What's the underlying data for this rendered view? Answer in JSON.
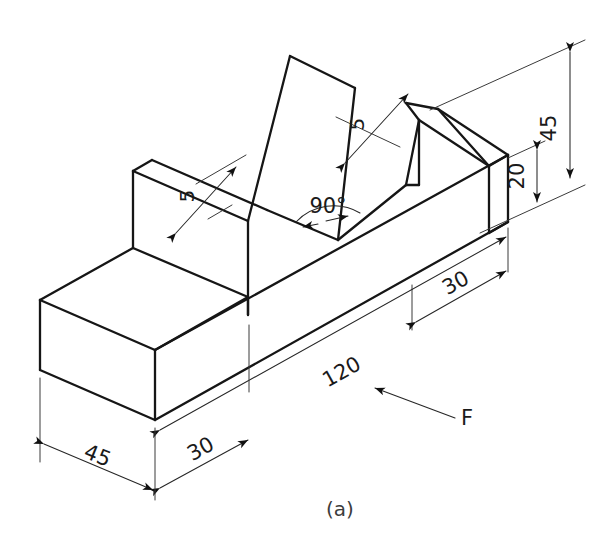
{
  "figure": {
    "caption": "(a)",
    "projection": "isometric",
    "units": "mm",
    "line_color": "#161616",
    "dimension_color": "#262626",
    "background": "#ffffff"
  },
  "dimensions": [
    {
      "id": "overall-height",
      "label": "45",
      "value": 45,
      "orientation": "vertical",
      "position": "right",
      "describes": "overall height of the part"
    },
    {
      "id": "base-height",
      "label": "20",
      "value": 20,
      "orientation": "vertical",
      "position": "right",
      "describes": "height of the base slab"
    },
    {
      "id": "overall-length",
      "label": "120",
      "value": 120,
      "orientation": "along-length",
      "position": "front-bottom",
      "describes": "overall length of the base"
    },
    {
      "id": "right-step-length",
      "label": "30",
      "value": 30,
      "orientation": "along-length",
      "position": "right-front",
      "describes": "length of the right end step"
    },
    {
      "id": "left-step-length",
      "label": "30",
      "value": 30,
      "orientation": "along-length",
      "position": "left-front-bottom",
      "describes": "length of the left end step"
    },
    {
      "id": "part-width",
      "label": "45",
      "value": 45,
      "orientation": "along-depth",
      "position": "left-bottom",
      "describes": "overall width/depth of the part"
    },
    {
      "id": "rib-thickness-left",
      "label": "5",
      "value": 5,
      "orientation": "along-depth",
      "position": "left-upright-top",
      "describes": "thickness of left upright rib"
    },
    {
      "id": "rib-thickness-right",
      "label": "5",
      "value": 5,
      "orientation": "along-depth",
      "position": "right-upright-top",
      "describes": "thickness of right upright rib"
    },
    {
      "id": "groove-angle",
      "label": "90°",
      "value": 90,
      "orientation": "angular",
      "position": "v-groove-vertex",
      "describes": "included angle of the V-groove"
    }
  ],
  "annotations": [
    {
      "id": "front-face-label",
      "label": "F",
      "describes": "front face designator with leader arrow"
    }
  ]
}
